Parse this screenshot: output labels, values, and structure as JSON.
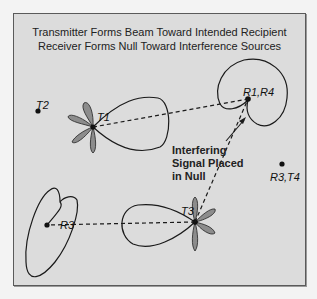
{
  "title": {
    "line1": "Transmitter Forms Beam Toward Intended Recipient",
    "line2": "Receiver Forms Null Toward Interference Sources"
  },
  "nodes": {
    "t1": {
      "label": "T1"
    },
    "t2": {
      "label": "T2"
    },
    "t3": {
      "label": "T3"
    },
    "r1r4": {
      "label": "R1,R4"
    },
    "r3": {
      "label": "R3"
    },
    "r3t4": {
      "label": "R3,T4"
    }
  },
  "annotation": {
    "line1": "Interfering",
    "line2": "Signal Placed",
    "line3": "in Null"
  },
  "colors": {
    "background": "#dcdcdc",
    "sidelobe_fill": "#8c8c8c",
    "line": "#1a1a1a"
  }
}
